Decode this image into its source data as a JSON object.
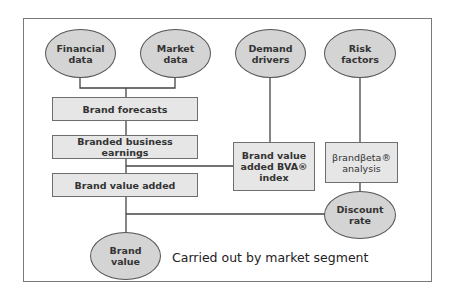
{
  "diagram": {
    "inputs": {
      "financial_data": "Financial\ndata",
      "market_data": "Market\ndata",
      "demand_drivers": "Demand\ndrivers",
      "risk_factors": "Risk\nfactors"
    },
    "steps": {
      "brand_forecasts": "Brand forecasts",
      "branded_business_earnings": "Branded business earnings",
      "brand_value_added": "Brand value added",
      "bva_index": "Brand value\nadded BVA®\nindex",
      "brandbeta_analysis": "βrandβeta®\nanalysis"
    },
    "outputs": {
      "discount_rate": "Discount\nrate",
      "brand_value": "Brand\nvalue"
    },
    "note": "Carried out by market segment"
  },
  "colors": {
    "ellipse_fill": "#d4d4d4",
    "box_fill": "#e6e6e6",
    "line": "#444444",
    "frame": "#7a7a7a"
  }
}
